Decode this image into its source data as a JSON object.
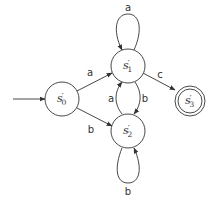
{
  "diagram": {
    "type": "finite-state-automaton",
    "colors": {
      "stroke": "#333333",
      "background": "#ffffff"
    },
    "states": [
      {
        "id": "s0",
        "name": "s",
        "prime": "′",
        "subscript": "0",
        "initial": true,
        "accepting": false
      },
      {
        "id": "s1",
        "name": "s",
        "prime": "′",
        "subscript": "1",
        "initial": false,
        "accepting": false
      },
      {
        "id": "s2",
        "name": "s",
        "prime": "′",
        "subscript": "2",
        "initial": false,
        "accepting": false
      },
      {
        "id": "s3",
        "name": "s",
        "prime": "′",
        "subscript": "3",
        "initial": false,
        "accepting": true
      }
    ],
    "transitions": [
      {
        "from": "s0",
        "to": "s1",
        "label": "a"
      },
      {
        "from": "s0",
        "to": "s2",
        "label": "b"
      },
      {
        "from": "s1",
        "to": "s1",
        "label": "a"
      },
      {
        "from": "s1",
        "to": "s2",
        "label": "b"
      },
      {
        "from": "s2",
        "to": "s1",
        "label": "a"
      },
      {
        "from": "s2",
        "to": "s2",
        "label": "b"
      },
      {
        "from": "s1",
        "to": "s3",
        "label": "c"
      }
    ]
  }
}
